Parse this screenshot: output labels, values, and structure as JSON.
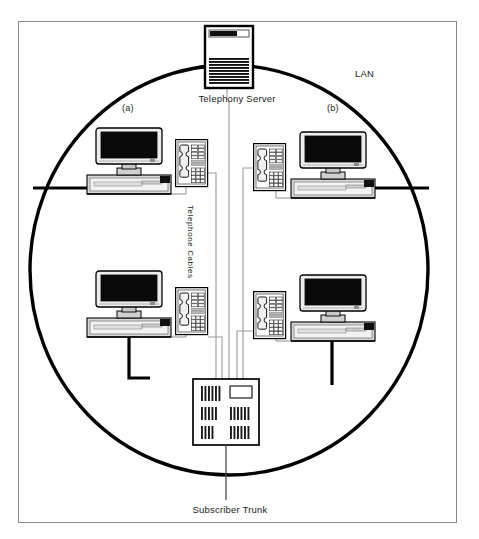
{
  "figure": {
    "frame": {
      "x": 18,
      "y": 21,
      "width": 439,
      "height": 502,
      "stroke": "#8a8a8a"
    },
    "background": "#ffffff",
    "ink": "#000000"
  },
  "labels": {
    "telephony_server": "Telephony Server",
    "subscriber_trunk": "Subscriber Trunk",
    "lan": "LAN",
    "station_a": "(a)",
    "station_b": "(b)",
    "telephone_cables": "Telephone Cables"
  },
  "nodes": {
    "server": {
      "name": "Telephony Server",
      "x": 205,
      "y": 26,
      "width": 48,
      "height": 62
    },
    "pbx": {
      "name": "PBX Switch",
      "x": 193,
      "y": 379,
      "width": 66,
      "height": 66
    },
    "workstations": [
      {
        "id": "a-top",
        "label": "(a)",
        "x": 86,
        "y": 127,
        "width": 85,
        "height": 68
      },
      {
        "id": "b-top",
        "label": "(b)",
        "x": 290,
        "y": 127,
        "width": 85,
        "height": 68
      },
      {
        "id": "a-bottom",
        "label": "",
        "x": 86,
        "y": 270,
        "width": 85,
        "height": 68
      },
      {
        "id": "b-bottom",
        "label": "",
        "x": 290,
        "y": 270,
        "width": 85,
        "height": 68
      }
    ],
    "telephones": [
      {
        "id": "phone-a-top",
        "x": 175,
        "y": 139,
        "width": 33,
        "height": 48
      },
      {
        "id": "phone-b-top",
        "x": 253,
        "y": 139,
        "width": 33,
        "height": 48
      },
      {
        "id": "phone-a-bottom",
        "x": 175,
        "y": 287,
        "width": 33,
        "height": 48
      },
      {
        "id": "phone-b-bottom",
        "x": 253,
        "y": 287,
        "width": 33,
        "height": 48
      }
    ]
  },
  "connections": {
    "lan_ellipse": {
      "cx": 229,
      "cy": 270,
      "rx": 199,
      "ry": 205,
      "stroke_width": 3.2
    },
    "trunk_line": {
      "x": 226,
      "y1": 445,
      "y2": 500
    },
    "server_line": {
      "x": 227,
      "y1": 88,
      "y2": 100
    }
  },
  "colors": {
    "frame_border": "#8a8a8a",
    "line_black": "#000000",
    "line_thin": "#555555",
    "screen_fill": "#0a0a0a",
    "case_fill": "#e8e8e8",
    "case_shadow": "#b8b8b8",
    "white": "#ffffff"
  }
}
